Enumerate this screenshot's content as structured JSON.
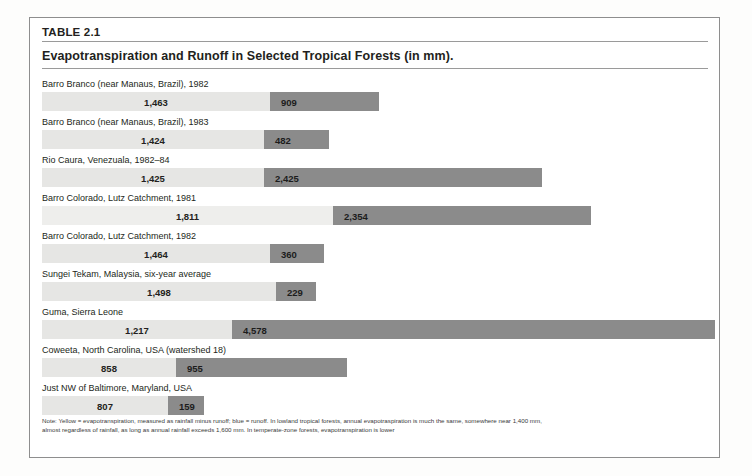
{
  "table": {
    "number": "TABLE 2.1",
    "title": "Evapotranspiration and Runoff in Selected Tropical Forests (in mm).",
    "note_line_1": "Note: Yellow = evapotranspiration, measured as rainfall minus runoff; blue = runoff. In lowland tropical forests, annual evapotraspiration is much the same, somewhere near 1,400 mm,",
    "note_line_2": "almost regardless of rainfall, as long as annual rainfall exceeds 1,600 mm. In temperate-zone forests, evapotranspiration is lower"
  },
  "legend": {
    "et_name": "evapotranspiration",
    "runoff_name": "runoff",
    "et_color": "#e6e6e4",
    "runoff_color": "#8b8b8b"
  },
  "chart_data": {
    "type": "bar",
    "title": "Evapotranspiration and Runoff in Selected Tropical Forests (in mm).",
    "xlabel": "",
    "ylabel": "",
    "stacked": true,
    "unit": "mm",
    "grid": false,
    "legend_position": "none",
    "series": [
      {
        "name": "evapotranspiration",
        "color": "#e6e6e4",
        "values": [
          1463,
          1424,
          1425,
          1811,
          1464,
          1498,
          1217,
          858,
          807
        ]
      },
      {
        "name": "runoff",
        "color": "#8b8b8b",
        "values": [
          909,
          482,
          2425,
          2354,
          360,
          229,
          4578,
          955,
          159
        ]
      }
    ],
    "categories": [
      "Barro Branco (near Manaus, Brazil), 1982",
      "Barro Branco (near Manaus, Brazil), 1983",
      "Rio Caura, Venezuala, 1982–84",
      "Barro Colorado, Lutz Catchment, 1981",
      "Barro Colorado, Lutz Catchment, 1982",
      "Sungei Tekam, Malaysia, six-year average",
      "Guma, Sierra Leone",
      "Coweeta, North Carolina, USA (watershed 18)",
      "Just NW of Baltimore, Maryland, USA"
    ],
    "labels": {
      "evapotranspiration": [
        "1,463",
        "1,424",
        "1,425",
        "1,811",
        "1,464",
        "1,498",
        "1,217",
        "858",
        "807"
      ],
      "runoff": [
        "909",
        "482",
        "2,425",
        "2,354",
        "360",
        "229",
        "4,578",
        "955",
        "159"
      ]
    }
  },
  "rows": [
    {
      "label": "Barro Branco (near Manaus, Brazil), 1982",
      "et_value": "1,463",
      "ro_value": "909",
      "et_px": 228,
      "ro_px": 109,
      "ro_left": 228,
      "pale": false
    },
    {
      "label": "Barro Branco (near Manaus, Brazil), 1983",
      "et_value": "1,424",
      "ro_value": "482",
      "et_px": 222,
      "ro_px": 65,
      "ro_left": 222,
      "pale": false
    },
    {
      "label": "Rio Caura, Venezuala, 1982–84",
      "et_value": "1,425",
      "ro_value": "2,425",
      "et_px": 222,
      "ro_px": 278,
      "ro_left": 222,
      "pale": false
    },
    {
      "label": "Barro Colorado, Lutz Catchment, 1981",
      "et_value": "1,811",
      "ro_value": "2,354",
      "et_px": 291,
      "ro_px": 258,
      "ro_left": 291,
      "pale": true
    },
    {
      "label": "Barro Colorado, Lutz Catchment, 1982",
      "et_value": "1,464",
      "ro_value": "360",
      "et_px": 228,
      "ro_px": 54,
      "ro_left": 228,
      "pale": false
    },
    {
      "label": "Sungei Tekam, Malaysia, six-year average",
      "et_value": "1,498",
      "ro_value": "229",
      "et_px": 234,
      "ro_px": 40,
      "ro_left": 234,
      "pale": false
    },
    {
      "label": "Guma, Sierra Leone",
      "et_value": "1,217",
      "ro_value": "4,578",
      "et_px": 190,
      "ro_px": 483,
      "ro_left": 190,
      "pale": false
    },
    {
      "label": "Coweeta, North Carolina, USA (watershed 18)",
      "et_value": "858",
      "ro_value": "955",
      "et_px": 134,
      "ro_px": 171,
      "ro_left": 134,
      "pale": false
    },
    {
      "label": "Just NW of Baltimore, Maryland, USA",
      "et_value": "807",
      "ro_value": "159",
      "et_px": 126,
      "ro_px": 36,
      "ro_left": 126,
      "pale": false
    }
  ]
}
